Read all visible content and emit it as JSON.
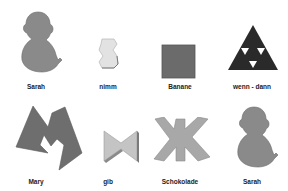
{
  "symbols": [
    {
      "label": "Sarah",
      "shape": "sarah-icon",
      "color": "#8a8a8a"
    },
    {
      "label": "nimm",
      "shape": "nimm-icon",
      "color": "#e2e2e2"
    },
    {
      "label": "Banane",
      "shape": "banane-icon",
      "color": "#6b6b6b"
    },
    {
      "label": "wenn - dann",
      "shape": "wenn-dann-icon",
      "color": "#2a2a2a"
    },
    {
      "label": "Mary",
      "shape": "mary-icon",
      "color": "#6e6e6e"
    },
    {
      "label": "gib",
      "shape": "gib-icon",
      "color": "#c4c4c4"
    },
    {
      "label": "Schokolade",
      "shape": "schokolade-icon",
      "color": "#a8a8a8"
    },
    {
      "label": "Sarah",
      "shape": "sarah-icon",
      "color": "#8a8a8a"
    }
  ]
}
